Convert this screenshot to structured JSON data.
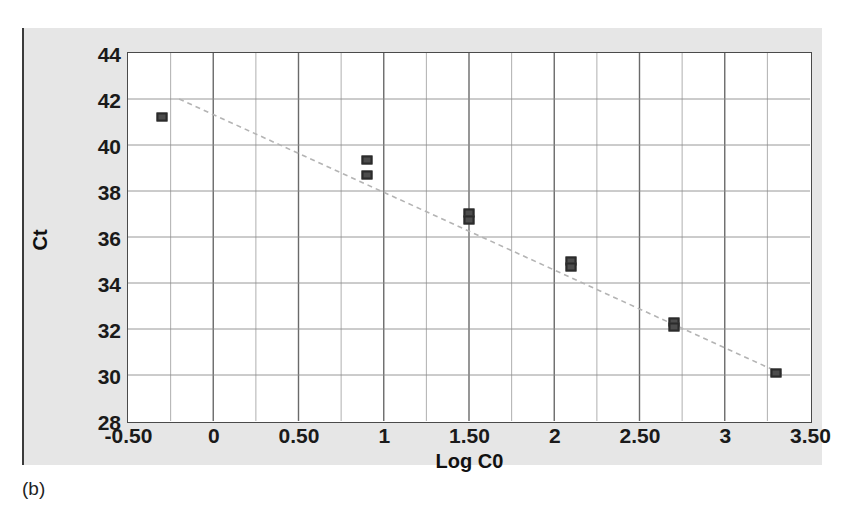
{
  "figure": {
    "caption": "(b)",
    "panel_bg": "#e6e6e6",
    "plot_bg": "#ffffff",
    "frame_color": "#4a4a4a",
    "marker_color": "#4d4d4d",
    "trendline_color": "#b4b4b4"
  },
  "chart_data": {
    "type": "scatter",
    "title": "",
    "xlabel": "Log C0",
    "ylabel": "Ct",
    "xlim": [
      -0.5,
      3.5
    ],
    "ylim": [
      28,
      44
    ],
    "grid": true,
    "legend": "none",
    "xticks": [
      -0.5,
      0,
      0.5,
      1,
      1.5,
      2,
      2.5,
      3,
      3.5
    ],
    "xticklabels": [
      "-0.50",
      "0",
      "0.50",
      "1",
      "1.50",
      "2",
      "2.50",
      "3",
      "3.50"
    ],
    "yticks": [
      28,
      30,
      32,
      34,
      36,
      38,
      40,
      42,
      44
    ],
    "yticklabels": [
      "28",
      "30",
      "32",
      "34",
      "36",
      "38",
      "40",
      "42",
      "44"
    ],
    "series": [
      {
        "name": "Ct vs Log C0",
        "marker": "square",
        "points": [
          {
            "x": -0.3,
            "y": 41.2
          },
          {
            "x": 0.9,
            "y": 39.35
          },
          {
            "x": 0.9,
            "y": 38.7
          },
          {
            "x": 1.5,
            "y": 37.05
          },
          {
            "x": 1.5,
            "y": 36.75
          },
          {
            "x": 2.1,
            "y": 34.95
          },
          {
            "x": 2.1,
            "y": 34.7
          },
          {
            "x": 2.7,
            "y": 32.3
          },
          {
            "x": 2.7,
            "y": 32.1
          },
          {
            "x": 3.3,
            "y": 30.1
          }
        ]
      }
    ],
    "trendline": {
      "style": "dashed",
      "x0": -0.2,
      "y0": 42.0,
      "x1": 3.35,
      "y1": 30.0
    }
  }
}
